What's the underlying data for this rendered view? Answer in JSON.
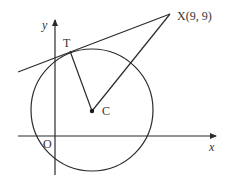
{
  "diagram": {
    "type": "geometry",
    "labels": {
      "y_axis": "y",
      "x_axis": "x",
      "origin": "O",
      "tangent_point": "T",
      "centre": "C",
      "external_point": "X(9, 9)"
    },
    "colors": {
      "stroke": "#2b2b2b",
      "text": "#333333",
      "background": "#ffffff"
    },
    "points": {
      "X": {
        "label": "X(9, 9)",
        "x": 9,
        "y": 9
      },
      "T": {
        "label": "T"
      },
      "C": {
        "label": "C"
      },
      "O": {
        "label": "O"
      }
    },
    "segments": [
      "XT (tangent line, extended)",
      "XC",
      "TC (radius)"
    ]
  }
}
